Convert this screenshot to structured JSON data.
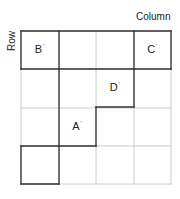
{
  "axes": {
    "column_label": "Column",
    "row_label": "Row"
  },
  "grid": {
    "rows": 4,
    "cols": 4,
    "origin": [
      21,
      31
    ],
    "cell_w": 37.5,
    "cell_h": 38.25,
    "light_color": "#cccccc",
    "dark_color": "#333333"
  },
  "cells": [
    {
      "id": "B",
      "label": "B",
      "mark": "'",
      "row": 0,
      "col": 0
    },
    {
      "id": "C",
      "label": "C",
      "mark": "'",
      "row": 0,
      "col": 3
    },
    {
      "id": "D",
      "label": "D",
      "mark": "'",
      "row": 1,
      "col": 2
    },
    {
      "id": "A",
      "label": "A",
      "mark": "'",
      "row": 2,
      "col": 1
    }
  ],
  "dark_segments": [
    [
      21,
      31,
      171,
      31
    ],
    [
      21,
      31,
      21,
      69
    ],
    [
      59,
      31,
      59,
      69
    ],
    [
      134,
      31,
      134,
      69
    ],
    [
      171,
      31,
      171,
      69
    ],
    [
      21,
      69,
      171,
      69
    ],
    [
      134,
      69,
      134,
      107
    ],
    [
      96,
      107,
      134,
      107
    ],
    [
      96,
      107,
      96,
      146
    ],
    [
      59,
      69,
      59,
      184
    ],
    [
      21,
      146,
      96,
      146
    ],
    [
      21,
      146,
      21,
      184
    ],
    [
      21,
      184,
      59,
      184
    ]
  ]
}
